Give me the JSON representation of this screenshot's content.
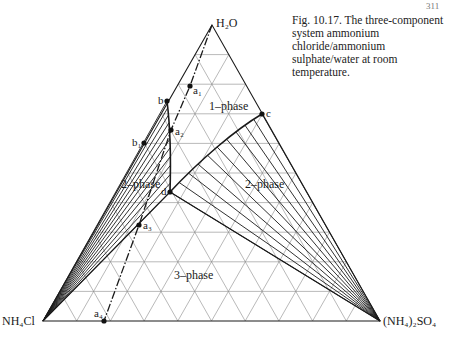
{
  "page": {
    "number": "311"
  },
  "caption": {
    "text": "Fig. 10.17. The three-component system ammonium chloride/ammonium sulphate/water at room temperature."
  },
  "chart_data": {
    "type": "ternary-phase-diagram",
    "title": "The three-component system ammonium chloride/ammonium sulphate/water at room temperature",
    "vertices": {
      "top": "H2O",
      "left": "NH4Cl",
      "right": "(NH4)2SO4"
    },
    "grid_divisions": 10,
    "regions": [
      {
        "label": "1-phase",
        "description": "unsaturated solution"
      },
      {
        "label": "2-phase",
        "side": "NH4Cl",
        "description": "solution + solid NH4Cl, tie lines to NH4Cl vertex"
      },
      {
        "label": "2-phase",
        "side": "(NH4)2SO4",
        "description": "solution + solid (NH4)2SO4, tie lines to (NH4)2SO4 vertex"
      },
      {
        "label": "3-phase",
        "description": "solution d + solid NH4Cl + solid (NH4)2SO4"
      }
    ],
    "points": [
      {
        "label": "a1",
        "region": "1-phase"
      },
      {
        "label": "a2",
        "region": "2-phase boundary"
      },
      {
        "label": "a3",
        "region": "3-phase boundary"
      },
      {
        "label": "a4",
        "region": "NH4Cl-(NH4)2SO4 edge"
      },
      {
        "label": "b",
        "region": "NH4Cl saturation on H2O-NH4Cl edge"
      },
      {
        "label": "b1",
        "region": "on H2O-NH4Cl edge"
      },
      {
        "label": "c",
        "region": "(NH4)2SO4 saturation on H2O-(NH4)2SO4 edge"
      },
      {
        "label": "d",
        "region": "eutonic point"
      }
    ],
    "curves": [
      {
        "name": "solubility curve NH4Cl",
        "from": "b",
        "to": "d"
      },
      {
        "name": "solubility curve (NH4)2SO4",
        "from": "c",
        "to": "d"
      },
      {
        "name": "evaporation path (dash-dot)",
        "from": "H2O",
        "through": [
          "a1",
          "a2",
          "a3"
        ],
        "to": "a4"
      }
    ]
  },
  "labels": {
    "h2o": "H₂O",
    "nh4cl": "NH₄Cl",
    "nh4so4": "(NH₄)₂SO₄",
    "one_phase": "1–phase",
    "two_phase_left": "2–phase",
    "two_phase_right": "2–phase",
    "three_phase": "3–phase",
    "a1": "a₁",
    "a2": "a₂",
    "a3": "a₃",
    "a4": "a₄",
    "b": "b",
    "b1": "b₁",
    "c": "c",
    "d": "d"
  }
}
